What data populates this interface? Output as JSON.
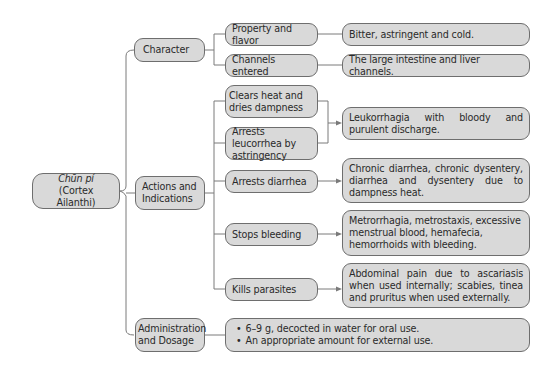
{
  "root": {
    "title": "Chūn pí",
    "subtitle": "(Cortex Ailanthi)"
  },
  "sections": {
    "character": {
      "label": "Character",
      "items": [
        {
          "label": "Property and flavor",
          "detail": "Bitter, astringent and cold."
        },
        {
          "label": "Channels entered",
          "detail": "The large intestine and liver channels."
        }
      ]
    },
    "actions": {
      "label": "Actions and Indications",
      "label_line1": "Actions and",
      "label_line2": "Indications",
      "items": [
        {
          "label": "Clears heat and dries dampness"
        },
        {
          "label": "Arrests leucorrhea by astringency"
        },
        {
          "label": "Arrests diarrhea",
          "detail": "Chronic diarrhea, chronic dysentery, diarrhea and dysentery due to dampness heat."
        },
        {
          "label": "Stops bleeding",
          "detail": "Metrorrhagia, metrostaxis, excessive menstrual blood, hemafecia, hemorrhoids with bleeding."
        },
        {
          "label": "Kills parasites",
          "detail": "Abdominal pain due to ascariasis when used internally; scabies, tinea and pruritus when used externally."
        }
      ],
      "shared_detail": "Leukorrhagia with bloody and purulent discharge."
    },
    "administration": {
      "label": "Administration and Dosage",
      "label_line1": "Administration",
      "label_line2": "and Dosage",
      "bullets": [
        "6–9 g, decocted in water for oral use.",
        "An appropriate amount for external use."
      ]
    }
  },
  "colors": {
    "box_fill": "#d9d9d9",
    "box_border": "#6e6e6e",
    "line": "#7a7a7a"
  }
}
